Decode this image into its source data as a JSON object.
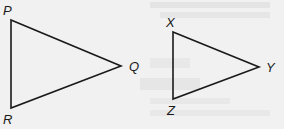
{
  "diagram": {
    "background": "#f1f1f1",
    "stroke_color": "#1a1a1a",
    "triangles": [
      {
        "name": "PQR",
        "vertices": [
          {
            "label": "P",
            "x": 11,
            "y": 20,
            "lx": 3,
            "ly": 15
          },
          {
            "label": "Q",
            "x": 121,
            "y": 66,
            "lx": 129,
            "ly": 71
          },
          {
            "label": "R",
            "x": 11,
            "y": 108,
            "lx": 3,
            "ly": 124
          }
        ]
      },
      {
        "name": "XYZ",
        "vertices": [
          {
            "label": "X",
            "x": 173,
            "y": 32,
            "lx": 166,
            "ly": 27
          },
          {
            "label": "Y",
            "x": 259,
            "y": 67,
            "lx": 266,
            "ly": 72
          },
          {
            "label": "Z",
            "x": 173,
            "y": 99,
            "lx": 167,
            "ly": 115
          }
        ]
      }
    ]
  }
}
